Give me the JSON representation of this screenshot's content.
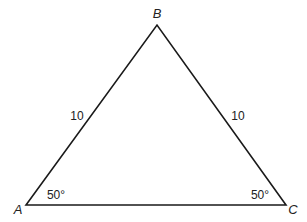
{
  "diagram": {
    "type": "triangle",
    "vertices": {
      "A": {
        "label": "A",
        "x": 26,
        "y": 205
      },
      "B": {
        "label": "B",
        "x": 157,
        "y": 25
      },
      "C": {
        "label": "C",
        "x": 286,
        "y": 205
      }
    },
    "sides": {
      "AB": {
        "label": "10"
      },
      "BC": {
        "label": "10"
      }
    },
    "angles": {
      "A": {
        "label": "50°"
      },
      "C": {
        "label": "50°"
      }
    },
    "stroke_color": "#1a1a1a"
  }
}
